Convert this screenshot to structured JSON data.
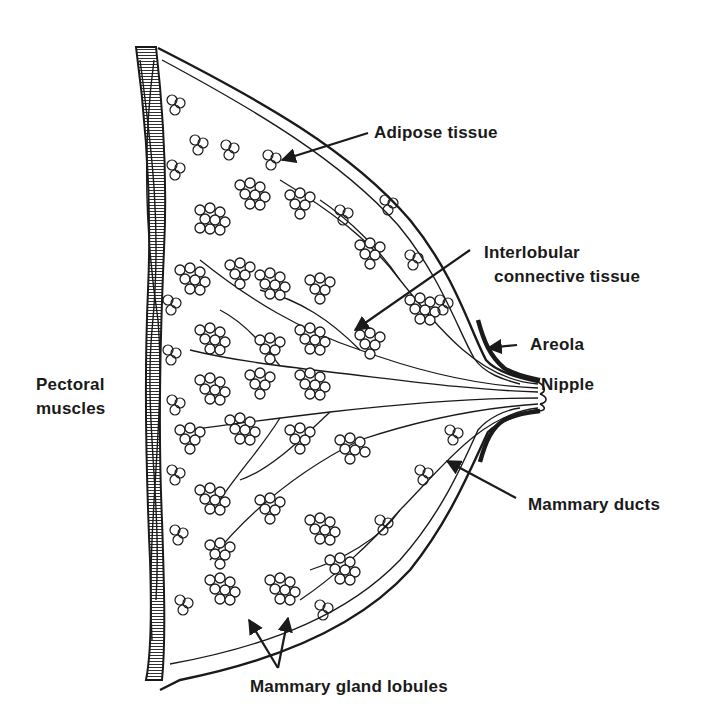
{
  "figure": {
    "colors": {
      "ink": "#1a1a1a",
      "background": "#ffffff"
    },
    "labels": {
      "adipose": "Adipose tissue",
      "interlobular_line1": "Interlobular",
      "interlobular_line2": "connective tissue",
      "areola": "Areola",
      "nipple": "Nipple",
      "pectoral_line1": "Pectoral",
      "pectoral_line2": "muscles",
      "ducts": "Mammary ducts",
      "lobules": "Mammary gland lobules"
    }
  }
}
